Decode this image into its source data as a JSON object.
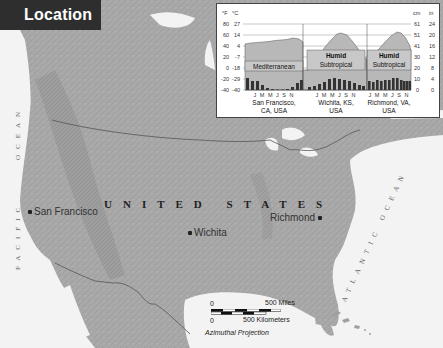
{
  "title": "Location",
  "map": {
    "country_label": "UNITED STATES",
    "oceans": [
      {
        "name": "PACIFIC OCEAN",
        "part1": "PACIFIC",
        "part2": "OCEAN"
      },
      {
        "name": "ATLANTIC OCEAN"
      }
    ],
    "cities": [
      {
        "name": "San Francisco",
        "x": 30,
        "y": 211
      },
      {
        "name": "Wichita",
        "x": 190,
        "y": 232
      },
      {
        "name": "Richmond",
        "x": 270,
        "y": 217
      }
    ],
    "colors": {
      "land": "#a9a9a9",
      "water": "#f4f4f4",
      "border": "#555555"
    }
  },
  "scale": {
    "miles_zero": "0",
    "miles_label": "500 Miles",
    "km_zero": "0",
    "km_label": "500 Kilometers",
    "projection": "Azimuthal Projection"
  },
  "climate_graphs": {
    "left_axis_f_header": "°F",
    "left_axis_c_header": "°C",
    "left_ticks": [
      {
        "f": "80",
        "c": "27"
      },
      {
        "f": "60",
        "c": "14"
      },
      {
        "f": "40",
        "c": "4"
      },
      {
        "f": "20",
        "c": "-7"
      },
      {
        "f": "0",
        "c": "-18"
      },
      {
        "f": "-20",
        "c": "-29"
      },
      {
        "f": "-40",
        "c": "-40"
      }
    ],
    "right_axis_cm_header": "cm",
    "right_axis_in_header": "in",
    "right_ticks": [
      {
        "cm": "61",
        "in": "24"
      },
      {
        "cm": "51",
        "in": "20"
      },
      {
        "cm": "41",
        "in": "16"
      },
      {
        "cm": "30",
        "in": "12"
      },
      {
        "cm": "20",
        "in": "8"
      },
      {
        "cm": "10",
        "in": "4"
      },
      {
        "cm": "0",
        "in": "0"
      }
    ],
    "month_labels": "J M M J S N",
    "stations": [
      {
        "climate": "Mediterranean",
        "location_line1": "San Francisco,",
        "location_line2": "CA, USA",
        "temp_f": [
          50,
          53,
          54,
          55,
          56,
          58,
          59,
          60,
          62,
          60,
          56,
          51
        ],
        "precip_in": [
          4.5,
          3.8,
          3.3,
          1.5,
          0.5,
          0.2,
          0.0,
          0.1,
          0.3,
          1.2,
          2.9,
          4.2
        ]
      },
      {
        "climate_line1": "Humid",
        "climate_line2": "Subtropical",
        "location_line1": "Wichita, KS,",
        "location_line2": "USA",
        "temp_f": [
          31,
          37,
          46,
          57,
          67,
          77,
          82,
          80,
          71,
          59,
          45,
          35
        ],
        "precip_in": [
          0.8,
          1.0,
          2.4,
          2.6,
          4.2,
          4.5,
          4.0,
          3.6,
          3.3,
          2.5,
          1.6,
          1.2
        ]
      },
      {
        "climate_line1": "Humid",
        "climate_line2": "Subtropical",
        "location_line1": "Richmond, VA,",
        "location_line2": "USA",
        "temp_f": [
          37,
          40,
          48,
          58,
          66,
          74,
          78,
          77,
          70,
          59,
          50,
          41
        ],
        "precip_in": [
          3.4,
          3.0,
          3.9,
          3.3,
          3.8,
          3.9,
          4.8,
          4.8,
          3.8,
          3.5,
          3.2,
          3.3
        ]
      }
    ]
  }
}
